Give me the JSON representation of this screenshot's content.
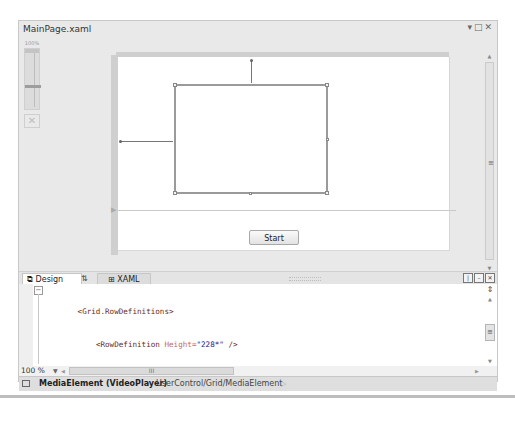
{
  "window": {
    "title": "MainPage.xaml",
    "controls": [
      "dropdown",
      "maximize",
      "close"
    ]
  },
  "zoom_slider": {
    "label": "100%",
    "fit_icon": "fit-to-screen-icon"
  },
  "design_surface": {
    "start_button_label": "Start",
    "selected_element": "MediaElement"
  },
  "tabs": [
    {
      "label": "Design",
      "icon": "design-icon",
      "active": true
    },
    {
      "label": "⇅",
      "icon": "swap-panes-icon",
      "active": false
    },
    {
      "label": "XAML",
      "icon": "xaml-icon",
      "active": false
    }
  ],
  "pane_buttons": [
    "vertical-split",
    "horizontal-split",
    "collapse-pane"
  ],
  "code": {
    "lines": [
      {
        "indent": "        ",
        "text": "<Grid.RowDefinitions>"
      },
      {
        "indent": "            ",
        "tag": "<RowDefinition",
        "attr": " Height=",
        "val": "\"228*\"",
        "end": " />"
      },
      {
        "indent": "            ",
        "tag": "<RowDefinition",
        "attr": " Height=",
        "val": "\"72*\"",
        "end": " />"
      },
      {
        "indent": "        ",
        "text": "</Grid.RowDefinitions>"
      },
      {
        "indent": "        ",
        "text": "<MediaElement Height=\"165\" HorizontalAlignment=\"Left\" Margin=\"85,41,0,0\" Name=\"Vide"
      },
      {
        "indent": "        ",
        "text": "<Button Content=\"Start\" Height=\"23\" Name=\"StartStopButton\" Width=\"75\" HorizontalAli"
      },
      {
        "indent": "    ",
        "text": "</Grid>"
      },
      {
        "indent": "",
        "text": "</UserControl>"
      }
    ]
  },
  "bottom_bar": {
    "zoom_value": "100 %",
    "hscroll_grip": "III"
  },
  "statusbar": {
    "element": "MediaElement (VideoPlayer)",
    "path": "UserControl/Grid/MediaElement",
    "arrow": "▷"
  }
}
